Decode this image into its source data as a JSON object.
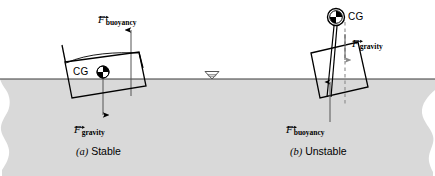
{
  "figure": {
    "name": "buoyancy-stability-diagram",
    "background_color": "#ffffff",
    "water_fill_color": "#d9d9d9",
    "line_color": "#000000",
    "width": 435,
    "height": 176
  },
  "water": {
    "surface_label_icon": "water-level-triangle-icon",
    "surface_y": 79
  },
  "panels": [
    {
      "id": "stable",
      "caption_enum": "(a)",
      "caption_text": "Stable",
      "cg_label": "CG",
      "buoyancy_label_symbol": "F",
      "buoyancy_label_subscript": "buoyancy",
      "gravity_label_symbol": "F",
      "gravity_label_subscript": "gravity"
    },
    {
      "id": "unstable",
      "caption_enum": "(b)",
      "caption_text": "Unstable",
      "cg_label": "CG",
      "buoyancy_label_symbol": "F",
      "buoyancy_label_subscript": "buoyancy",
      "gravity_label_symbol": "F",
      "gravity_label_subscript": "gravity"
    }
  ],
  "labels": {
    "stable_buoyancy_F": "F",
    "stable_buoyancy_sub": "buoyancy",
    "stable_gravity_F": "F",
    "stable_gravity_sub": "gravity",
    "stable_cg": "CG",
    "stable_caption_enum": "(a)",
    "stable_caption_word": "Stable",
    "unstable_gravity_F": "F",
    "unstable_gravity_sub": "gravity",
    "unstable_buoyancy_F": "F",
    "unstable_buoyancy_sub": "buoyancy",
    "unstable_cg": "CG",
    "unstable_caption_enum": "(b)",
    "unstable_caption_word": "Unstable"
  }
}
